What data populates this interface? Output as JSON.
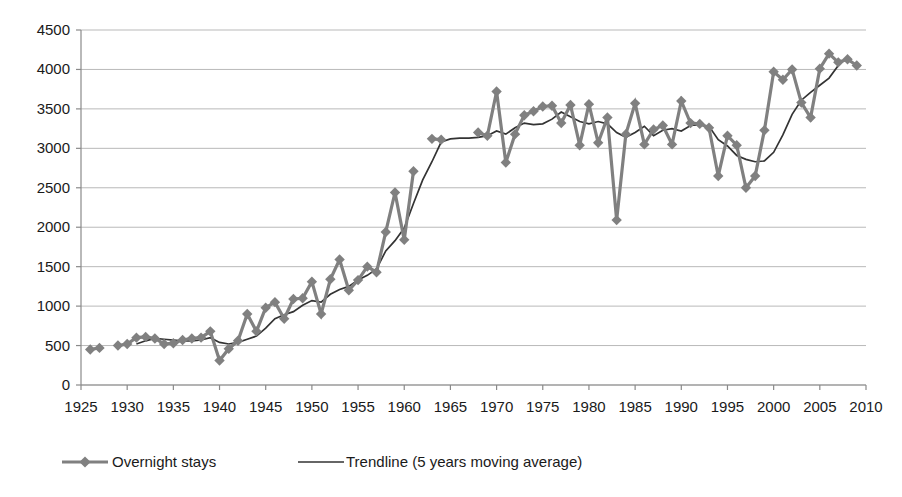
{
  "chart_data": {
    "type": "line",
    "title": "",
    "subtitle": "",
    "xlabel": "",
    "ylabel": "",
    "xlim": [
      1925,
      2010
    ],
    "ylim": [
      0,
      4500
    ],
    "y_ticks": [
      0,
      500,
      1000,
      1500,
      2000,
      2500,
      3000,
      3500,
      4000,
      4500
    ],
    "x_ticks": [
      1925,
      1930,
      1935,
      1940,
      1945,
      1950,
      1955,
      1960,
      1965,
      1970,
      1975,
      1980,
      1985,
      1990,
      1995,
      2000,
      2005,
      2010
    ],
    "grid": "horizontal",
    "legend_position": "bottom-left",
    "legend": [
      {
        "name": "Overnight stays",
        "style": "line-marker",
        "color": "#808080"
      },
      {
        "name": "Trendline (5 years moving average)",
        "style": "line",
        "color": "#333333"
      }
    ],
    "series": [
      {
        "name": "Overnight stays",
        "color": "#808080",
        "marker": "diamond",
        "segments": [
          {
            "x": [
              1926,
              1927
            ],
            "y": [
              450,
              470
            ]
          },
          {
            "x": [
              1929,
              1930,
              1931,
              1932,
              1933,
              1934,
              1935,
              1936,
              1937,
              1938,
              1939,
              1940,
              1941,
              1942,
              1943,
              1944,
              1945,
              1946,
              1947,
              1948,
              1949,
              1950,
              1951,
              1952,
              1953,
              1954,
              1955,
              1956,
              1957,
              1958,
              1959,
              1960,
              1961
            ],
            "y": [
              500,
              520,
              600,
              610,
              590,
              520,
              530,
              570,
              590,
              600,
              680,
              310,
              460,
              560,
              900,
              680,
              980,
              1050,
              840,
              1090,
              1100,
              1310,
              900,
              1340,
              1590,
              1200,
              1330,
              1500,
              1430,
              1940,
              2440,
              1840,
              2710
            ]
          },
          {
            "x": [
              1963,
              1964
            ],
            "y": [
              3120,
              3110
            ]
          },
          {
            "x": [
              1968,
              1969,
              1970,
              1971,
              1972,
              1973,
              1974,
              1975,
              1976,
              1977,
              1978,
              1979,
              1980,
              1981,
              1982,
              1983,
              1984,
              1985,
              1986,
              1987,
              1988,
              1989,
              1990,
              1991,
              1992,
              1993,
              1994,
              1995,
              1996,
              1997,
              1998,
              1999,
              2000,
              2001,
              2002,
              2003,
              2004,
              2005,
              2006,
              2007,
              2008,
              2009
            ],
            "y": [
              3200,
              3160,
              3720,
              2820,
              3180,
              3420,
              3470,
              3530,
              3540,
              3320,
              3550,
              3040,
              3560,
              3070,
              3390,
              2090,
              3180,
              3570,
              3050,
              3240,
              3290,
              3050,
              3600,
              3320,
              3310,
              3260,
              2650,
              3160,
              3040,
              2500,
              2650,
              3230,
              3970,
              3870,
              4000,
              3580,
              3390,
              4010,
              4200,
              4090,
              4130,
              4050
            ]
          }
        ]
      },
      {
        "name": "Trendline (5 years moving average)",
        "color": "#333333",
        "x": [
          1931,
          1932,
          1933,
          1934,
          1935,
          1936,
          1937,
          1938,
          1939,
          1940,
          1941,
          1942,
          1943,
          1944,
          1945,
          1946,
          1947,
          1948,
          1949,
          1950,
          1951,
          1952,
          1953,
          1954,
          1955,
          1956,
          1957,
          1958,
          1959,
          1960,
          1961,
          1962,
          1963,
          1964,
          1965,
          1966,
          1967,
          1968,
          1969,
          1970,
          1971,
          1972,
          1973,
          1974,
          1975,
          1976,
          1977,
          1978,
          1979,
          1980,
          1981,
          1982,
          1983,
          1984,
          1985,
          1986,
          1987,
          1988,
          1989,
          1990,
          1991,
          1992,
          1993,
          1994,
          1995,
          1996,
          1997,
          1998,
          1999,
          2000,
          2001,
          2002,
          2003,
          2004,
          2005,
          2006,
          2007
        ],
        "y": [
          520,
          560,
          590,
          580,
          570,
          560,
          560,
          570,
          600,
          540,
          520,
          540,
          580,
          620,
          720,
          840,
          890,
          930,
          1010,
          1070,
          1050,
          1150,
          1210,
          1250,
          1330,
          1390,
          1470,
          1700,
          1830,
          1990,
          2300,
          2600,
          2830,
          3080,
          3120,
          3130,
          3130,
          3140,
          3160,
          3220,
          3180,
          3260,
          3320,
          3300,
          3310,
          3370,
          3460,
          3400,
          3340,
          3310,
          3340,
          3310,
          3200,
          3140,
          3200,
          3280,
          3160,
          3230,
          3250,
          3220,
          3290,
          3300,
          3280,
          3110,
          3030,
          2910,
          2860,
          2830,
          2840,
          2950,
          3170,
          3430,
          3610,
          3710,
          3800,
          3890,
          4050
        ]
      }
    ]
  },
  "axis": {
    "y_tick_labels": [
      "0",
      "500",
      "1000",
      "1500",
      "2000",
      "2500",
      "3000",
      "3500",
      "4000",
      "4500"
    ],
    "x_tick_labels": [
      "1925",
      "1930",
      "1935",
      "1940",
      "1945",
      "1950",
      "1955",
      "1960",
      "1965",
      "1970",
      "1975",
      "1980",
      "1985",
      "1990",
      "1995",
      "2000",
      "2005",
      "2010"
    ]
  },
  "legend": {
    "series_label": "Overnight stays",
    "trend_label": "Trendline (5 years moving average)"
  },
  "colors": {
    "series": "#808080",
    "trend": "#333333",
    "grid": "#b9b9b9",
    "axis": "#8a8a8a",
    "text": "#1a1a1a",
    "background": "#ffffff"
  }
}
